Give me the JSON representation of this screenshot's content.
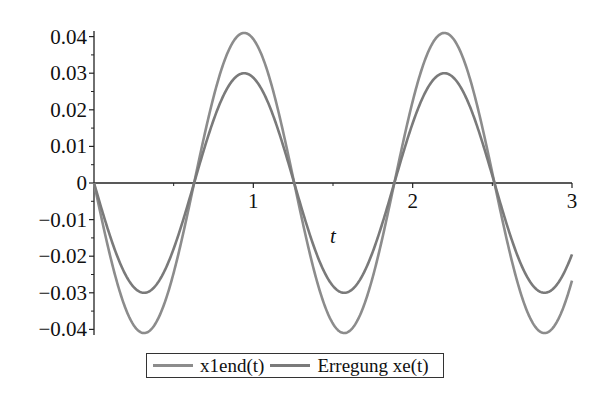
{
  "chart_data": {
    "type": "line",
    "title": "",
    "xlabel": "t",
    "ylabel": "",
    "xlim": [
      0,
      3
    ],
    "ylim": [
      -0.04,
      0.04
    ],
    "x_ticks": [
      1,
      2,
      3
    ],
    "x_tick_labels": [
      "1",
      "2",
      "3"
    ],
    "y_ticks": [
      0.04,
      0.03,
      0.02,
      0.01,
      0,
      -0.01,
      -0.02,
      -0.03,
      -0.04
    ],
    "y_tick_labels": [
      "0.04",
      "0.03",
      "0.02",
      "0.01",
      "0",
      "−0.01",
      "−0.02",
      "−0.03",
      "−0.04"
    ],
    "grid": false,
    "legend_position": "bottom",
    "series": [
      {
        "name": "x1end(t)",
        "color": "#8c8c8c",
        "formula": "-0.041*sin(5*t)",
        "amplitude": 0.041,
        "omega": 5,
        "x": [
          0,
          0.314,
          0.628,
          0.942,
          1.257,
          1.571,
          1.885,
          2.199,
          2.513,
          2.827,
          3.0
        ],
        "values": [
          0,
          -0.041,
          0,
          0.041,
          0,
          -0.041,
          0,
          0.041,
          0,
          -0.041,
          -0.0267
        ]
      },
      {
        "name": "Erregung xe(t)",
        "color": "#7a7a7a",
        "formula": "-0.030*sin(5*t)",
        "amplitude": 0.03,
        "omega": 5,
        "x": [
          0,
          0.314,
          0.628,
          0.942,
          1.257,
          1.571,
          1.885,
          2.199,
          2.513,
          2.827,
          3.0
        ],
        "values": [
          0,
          -0.03,
          0,
          0.03,
          0,
          -0.03,
          0,
          0.03,
          0,
          -0.03,
          -0.0195
        ]
      }
    ]
  },
  "legend": {
    "items": [
      {
        "label": "x1end(t)",
        "color": "#8c8c8c"
      },
      {
        "label": "Erregung xe(t)",
        "color": "#7a7a7a"
      }
    ]
  }
}
